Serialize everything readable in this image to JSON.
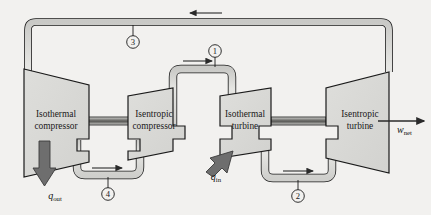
{
  "diagram": {
    "background_color": "#f2f1ef",
    "device_fill": "#d8d8d6",
    "pipe_fill": "#d9d9d7",
    "line_color": "#1a1a1a",
    "arrow_fill": "#6e6e6e"
  },
  "devices": [
    {
      "id": "isothermal-compressor",
      "line1": "Isothermal",
      "line2": "compressor"
    },
    {
      "id": "isentropic-compressor",
      "line1": "Isentropic",
      "line2": "compressor"
    },
    {
      "id": "isothermal-turbine",
      "line1": "Isothermal",
      "line2": "turbine"
    },
    {
      "id": "isentropic-turbine",
      "line1": "Isentropic",
      "line2": "turbine"
    }
  ],
  "states": [
    {
      "id": "state-1",
      "number": "1"
    },
    {
      "id": "state-2",
      "number": "2"
    },
    {
      "id": "state-3",
      "number": "3"
    },
    {
      "id": "state-4",
      "number": "4"
    }
  ],
  "energy_flows": [
    {
      "id": "heat-in",
      "symbol": "q",
      "subscript": "in"
    },
    {
      "id": "heat-out",
      "symbol": "q",
      "subscript": "out"
    },
    {
      "id": "work-net",
      "symbol": "w",
      "subscript": "net"
    }
  ]
}
